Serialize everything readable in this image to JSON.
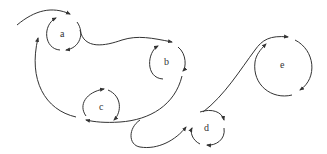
{
  "diagram": {
    "stroke_color": "#333333",
    "background": "#ffffff",
    "nodes": [
      {
        "id": "a",
        "label": "a",
        "cx": 63,
        "cy": 33,
        "r": 16
      },
      {
        "id": "b",
        "label": "b",
        "cx": 167,
        "cy": 62,
        "r": 17
      },
      {
        "id": "c",
        "label": "c",
        "cx": 102,
        "cy": 106,
        "r": 18
      },
      {
        "id": "d",
        "label": "d",
        "cx": 207,
        "cy": 128,
        "r": 16
      },
      {
        "id": "e",
        "label": "e",
        "cx": 283,
        "cy": 65,
        "r": 30
      }
    ],
    "paths": [
      "entry curve into a",
      "a to b connecting curve",
      "b to c sweeping curve",
      "c loop back to a",
      "loop from c to d",
      "d to e rising curve"
    ]
  }
}
